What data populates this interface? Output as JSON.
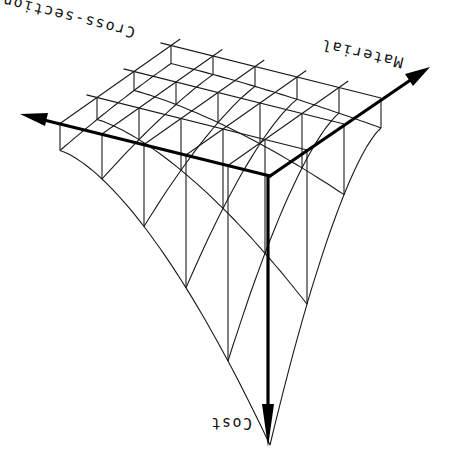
{
  "diagram": {
    "title": "",
    "orientation": "rotated 180 degrees",
    "axes": [
      {
        "id": "cross-section",
        "label": "Cross-section"
      },
      {
        "id": "material",
        "label": "Material"
      },
      {
        "id": "cost",
        "label": "Cost"
      }
    ],
    "colors": {
      "ink": "#000000",
      "background": "#ffffff"
    }
  }
}
